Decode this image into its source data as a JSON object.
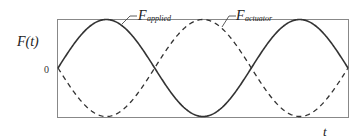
{
  "chart_data": {
    "type": "line",
    "title": "",
    "xlabel": "t",
    "ylabel": "F(t)",
    "ytick_labels": [
      "0"
    ],
    "grid": false,
    "legend_position": "inline-annotations",
    "x_range": [
      0,
      3
    ],
    "y_range": [
      -1,
      1
    ],
    "series": [
      {
        "name": "F applied",
        "label_main": "F",
        "label_sub": "applied",
        "style": "solid",
        "function": "sin(2*pi*x/2)",
        "x": [
          0,
          0.5,
          1.0,
          1.5,
          2.0,
          2.5,
          3.0
        ],
        "values": [
          0,
          1,
          0,
          -1,
          0,
          1,
          0
        ]
      },
      {
        "name": "F actuator",
        "label_main": "F",
        "label_sub": "actuator",
        "style": "dashed",
        "function": "-sin(2*pi*x/2)",
        "x": [
          0,
          0.5,
          1.0,
          1.5,
          2.0,
          2.5,
          3.0
        ],
        "values": [
          0,
          -1,
          0,
          1,
          0,
          -1,
          0
        ]
      }
    ]
  },
  "labels": {
    "ylabel": "F(t)",
    "xlabel": "t",
    "zero": "0",
    "applied_main": "F",
    "applied_sub": "applied",
    "actuator_main": "F",
    "actuator_sub": "actuator"
  }
}
